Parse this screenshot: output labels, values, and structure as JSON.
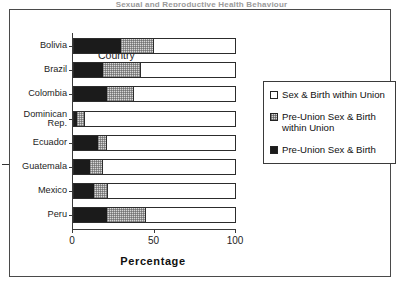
{
  "figure": {
    "title": "Sexual and Reproductive Health Behaviour",
    "frame_border_color": "#4a4a4a"
  },
  "annotation": {
    "arrow_icon": "right-arrow-icon",
    "points_at": "Guatemala"
  },
  "legend": {
    "items": [
      {
        "label": "Sex & Birth within Union",
        "swatch": "white",
        "color": "#ffffff"
      },
      {
        "label": "Pre-Union Sex & Birth\nwithin Union",
        "swatch": "mid",
        "color": "#d7d7d7"
      },
      {
        "label": "Pre-Union Sex & Birth",
        "swatch": "dark",
        "color": "#1b1b1b"
      }
    ]
  },
  "chart_data": {
    "type": "bar",
    "orientation": "horizontal",
    "stacked": true,
    "title": "",
    "xlabel": "Percentage",
    "ylabel": "Country",
    "xlim": [
      0,
      100
    ],
    "xticks": [
      0,
      50,
      100
    ],
    "xtick_labels": [
      "0",
      "50",
      "100"
    ],
    "grid": false,
    "legend_position": "right",
    "categories": [
      "Bolivia",
      "Brazil",
      "Colombia",
      "Dominican\nRep.",
      "Ecuador",
      "Guatemala",
      "Mexico",
      "Peru"
    ],
    "series": [
      {
        "name": "Pre-Union Sex & Birth",
        "color": "#1b1b1b",
        "values": [
          29,
          18,
          20,
          2,
          15,
          10,
          12,
          20
        ]
      },
      {
        "name": "Pre-Union Sex & Birth within Union",
        "color": "#d7d7d7",
        "values": [
          20,
          23,
          17,
          5,
          5,
          8,
          9,
          24
        ]
      },
      {
        "name": "Sex & Birth within Union",
        "color": "#ffffff",
        "values": [
          51,
          59,
          63,
          93,
          80,
          82,
          79,
          56
        ]
      }
    ]
  }
}
